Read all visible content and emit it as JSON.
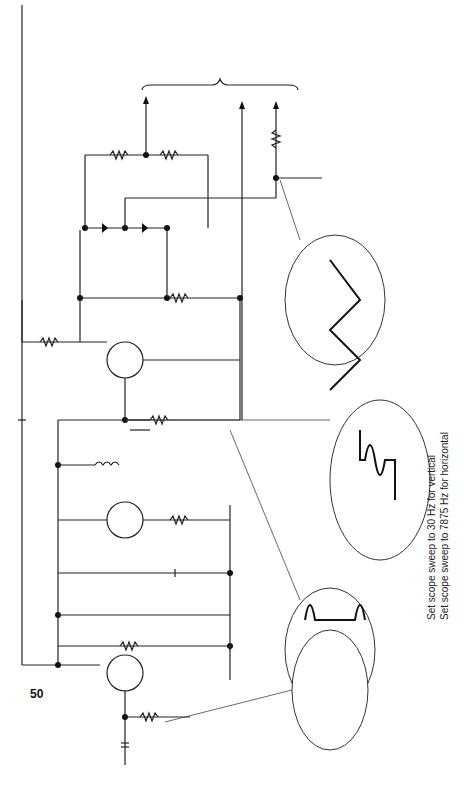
{
  "page_number": "50",
  "labels": {
    "sync_pulses": "Sync pulses",
    "sync_amp": "Sync amp",
    "vert_sync": "Vert sync",
    "horiz_phase_inv": "Horiz phase inv",
    "to_vertical_sweep": "To vertical sweep",
    "to_horizontal_sweep": "To horizontal sweep",
    "supply": "+12 V"
  },
  "components": {
    "C1": {
      "name": "C1"
    },
    "C2": {
      "name": "C2",
      "value": "0.07"
    },
    "C3": {
      "name": "C3",
      "value": "0.07"
    },
    "C4": {
      "name": "C4",
      "value": "0.07"
    },
    "C5": {
      "name": "C5",
      "value": "0.07"
    },
    "C6": {
      "name": "C6"
    },
    "R1": {
      "name": "R1",
      "value": "15 K"
    },
    "R2": {
      "name": "R2",
      "value": "3 K"
    },
    "R3": {
      "name": "R3",
      "value": "7 K"
    },
    "R4": {
      "name": "R4",
      "value": "700"
    },
    "R5": {
      "name": "R5",
      "value": "10 K"
    },
    "R6": {
      "name": "R6"
    },
    "R7": {
      "name": "R7",
      "value": "700"
    },
    "R8": {
      "name": "R8",
      "value": "3 K"
    },
    "R9": {
      "name": "R9",
      "value": "3 K"
    },
    "R10": {
      "name": "R10",
      "value": "2 K"
    },
    "Q1": {
      "name": "Q1"
    },
    "Q2": {
      "name": "Q2"
    },
    "Q3": {
      "name": "Q3"
    },
    "D1": {
      "name": "D1"
    },
    "D2": {
      "name": "D2"
    },
    "D3": {
      "name": "D3"
    },
    "T1": {
      "name": "T1",
      "winding": "20 Ω"
    }
  },
  "voltages": {
    "q2_base": "1 V",
    "q2_collector": "11 V"
  },
  "scopes": [
    {
      "id": "scope-1",
      "amplitude": "7 V",
      "frequency": "15,750 Hz"
    },
    {
      "id": "scope-2",
      "amplitude": "10 V",
      "frequency": "60 Hz"
    },
    {
      "id": "scope-3",
      "amplitude": "11 V",
      "frequency": "15,750 Hz"
    },
    {
      "id": "scope-4",
      "amplitude": "7 V",
      "frequency": "15,750 Hz"
    }
  ],
  "notes": [
    "Set scope sweep to 30 Hz for vertical",
    "Set scope sweep to 7875 Hz for horizontal"
  ]
}
